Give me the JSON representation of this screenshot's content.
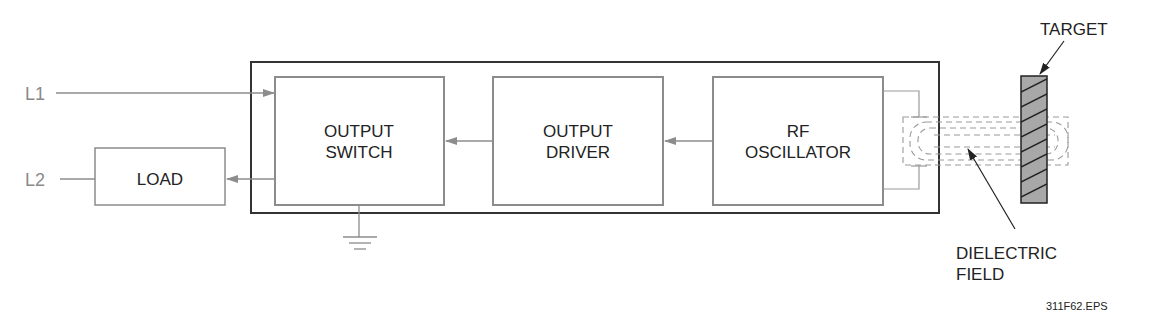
{
  "diagram": {
    "type": "proximity sensor block diagram",
    "inputs": {
      "l1": "L1",
      "l2": "L2"
    },
    "blocks": [
      {
        "id": "load",
        "lines": [
          "LOAD"
        ]
      },
      {
        "id": "output_switch",
        "lines": [
          "OUTPUT",
          "SWITCH"
        ]
      },
      {
        "id": "output_driver",
        "lines": [
          "OUTPUT",
          "DRIVER"
        ]
      },
      {
        "id": "rf_oscillator",
        "lines": [
          "RF",
          "OSCILLATOR"
        ]
      }
    ],
    "callouts": {
      "target": "TARGET",
      "field_line1": "DIELECTRIC",
      "field_line2": "FIELD"
    },
    "caption": "311F62.EPS",
    "colors": {
      "outer_border": "#333333",
      "block_border": "#8c8c8c",
      "target_fill": "#a8a8a8",
      "field_dash": "#9a9a9a"
    }
  }
}
